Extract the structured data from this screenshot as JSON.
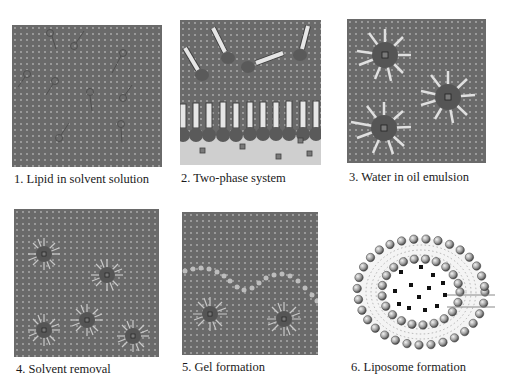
{
  "figure": {
    "colors": {
      "solvent": "#6a6a6a",
      "dots": "#a8a8a8",
      "aqueous": "#cfcfcf",
      "lipid_head": "#5a5a5a",
      "lipid_tail": "#e6e6e6",
      "cargo": "#7a7a7a",
      "liposome_head": "#9a9a9a"
    },
    "panels": [
      {
        "step": 1,
        "caption": "1. Lipid in solvent solution"
      },
      {
        "step": 2,
        "caption": "2. Two-phase system"
      },
      {
        "step": 3,
        "caption": "3. Water in oil emulsion"
      },
      {
        "step": 4,
        "caption": "4. Solvent removal"
      },
      {
        "step": 5,
        "caption": "5. Gel formation"
      },
      {
        "step": 6,
        "caption": "6. Liposome formation"
      }
    ]
  }
}
